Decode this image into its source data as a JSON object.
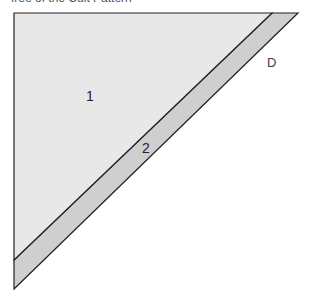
{
  "caption": "free of the Cult Pattern",
  "diagram": {
    "regions": [
      {
        "id": "1",
        "label": "1",
        "fill": "#e8e8e8"
      },
      {
        "id": "2",
        "label": "2",
        "fill": "#cfcfcf"
      }
    ],
    "edge_label": "D",
    "stroke": "#222222"
  }
}
